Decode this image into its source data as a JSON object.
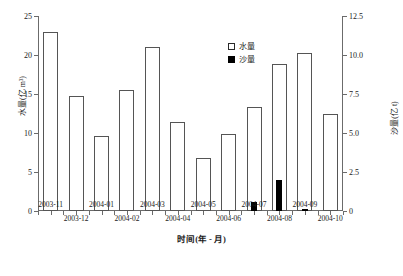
{
  "chart_data": {
    "type": "bar",
    "title": "",
    "xlabel": "时间(年 - 月)",
    "ylabel": "水量(亿 m³)",
    "y2label": "沙量(亿 t)",
    "categories": [
      "2003-11",
      "2003-12",
      "2004-01",
      "2004-02",
      "2004-03",
      "2004-04",
      "2004-05",
      "2004-06",
      "2004-07",
      "2004-08",
      "2004-09",
      "2004-10"
    ],
    "series": [
      {
        "name": "水量",
        "axis": "left",
        "unit": "亿 m³",
        "color": "#ffffff",
        "edge_color": "#555555",
        "values": [
          23.0,
          14.7,
          9.6,
          15.5,
          21.0,
          11.4,
          6.8,
          9.9,
          13.3,
          18.9,
          20.3,
          12.4
        ]
      },
      {
        "name": "沙量",
        "axis": "right",
        "unit": "亿 t",
        "color": "#000000",
        "edge_color": "#000000",
        "values": [
          0,
          0,
          0,
          0,
          0,
          0,
          0,
          0,
          0.55,
          2.0,
          0.1,
          0
        ]
      }
    ],
    "ylim": [
      0,
      25
    ],
    "yticks": [
      0,
      5,
      10,
      15,
      20,
      25
    ],
    "ytick_labels": [
      "0",
      "5",
      "10",
      "15",
      "20",
      "25"
    ],
    "y2lim": [
      0,
      12.5
    ],
    "y2ticks": [
      0,
      2.5,
      5.0,
      7.5,
      10.0,
      12.5
    ],
    "y2tick_labels": [
      "0",
      "2.5",
      "5.0",
      "7.5",
      "10.0",
      "12.5"
    ],
    "grid": false,
    "legend_position": "upper-center"
  },
  "legend": {
    "items": [
      {
        "label": "水量",
        "swatch": "open-square"
      },
      {
        "label": "沙量",
        "swatch": "filled-square"
      }
    ]
  }
}
